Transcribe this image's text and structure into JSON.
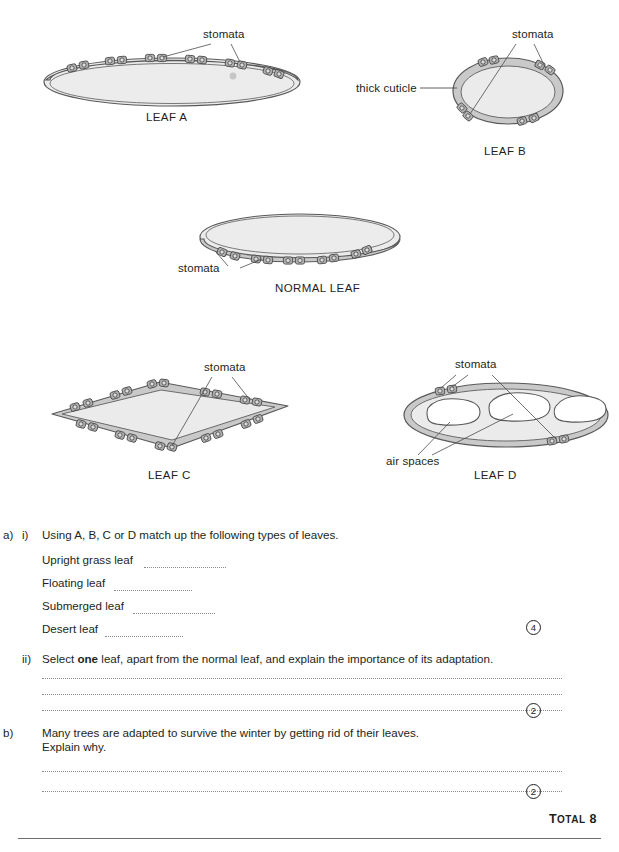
{
  "diagrams": {
    "leaf_a": {
      "caption": "LEAF A",
      "stomata_label": "stomata"
    },
    "leaf_b": {
      "caption": "LEAF B",
      "stomata_label": "stomata",
      "cuticle_label": "thick cuticle"
    },
    "normal_leaf": {
      "caption": "NORMAL LEAF",
      "stomata_label": "stomata"
    },
    "leaf_c": {
      "caption": "LEAF C",
      "stomata_label": "stomata"
    },
    "leaf_d": {
      "caption": "LEAF D",
      "stomata_label": "stomata",
      "air_spaces_label": "air spaces"
    }
  },
  "questions": {
    "a": {
      "letter": "a)",
      "i": {
        "numeral": "i)",
        "text": "Using A, B, C or D match up the following types of leaves.",
        "items": [
          "Upright grass leaf",
          "Floating leaf",
          "Submerged leaf",
          "Desert leaf"
        ],
        "marks": "4"
      },
      "ii": {
        "numeral": "ii)",
        "text_before": "Select ",
        "text_bold": "one",
        "text_after": " leaf, apart from the normal leaf, and explain the importance of its adaptation.",
        "marks": "2"
      }
    },
    "b": {
      "letter": "b)",
      "line1": "Many trees are adapted to survive the winter by getting rid of their leaves.",
      "line2": "Explain why.",
      "marks": "2"
    }
  },
  "footer": {
    "total_word": "T",
    "total_rest": "OTAL",
    "total_value": "8"
  },
  "colors": {
    "ink": "#231f20",
    "leaf_fill": "#e8e8e8",
    "cuticle_fill": "#cfcfcf",
    "stoma_fill": "#b3b3b3",
    "outline": "#595959",
    "dots": "#8a8a8a"
  }
}
